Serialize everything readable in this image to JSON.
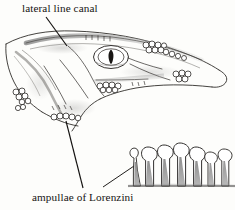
{
  "figure": {
    "background_color": "#fdfdfb",
    "ink_color": "#161412",
    "labels": [
      {
        "id": "lateral-line-canal",
        "text": "lateral line canal",
        "x": 22,
        "y": 3
      },
      {
        "id": "ampullae-of-lorenzini",
        "text": "ampullae of Lorenzini",
        "x": 32,
        "y": 192
      }
    ],
    "leader_lines": [
      {
        "id": "leader-lateral-line-canal",
        "from": [
          46,
          17
        ],
        "to": [
          67,
          45
        ]
      },
      {
        "id": "leader-ampullae-head",
        "from": [
          83,
          189
        ],
        "to": [
          66,
          121
        ]
      },
      {
        "id": "leader-ampullae-detail",
        "from": [
          103,
          188
        ],
        "to": [
          133,
          166
        ]
      }
    ],
    "parts": {
      "head": "shark head in left profile, snout pointing right",
      "eye": "oval eye with dark vertical slit pupil",
      "lateral_line_canal": "shaded canal running along dorsal margin of head",
      "pore_clusters": "clusters of small circles marking ampullary pores on snout, cheek and lower jaw",
      "ampullae_detail": "inset of seven flask-shaped ampullae with gray tapering canals"
    },
    "ampullae_detail": {
      "count": 7,
      "bulb_fill": "#ffffff",
      "canal_fill": "#8d8d8d",
      "baseline_y": 186
    }
  }
}
